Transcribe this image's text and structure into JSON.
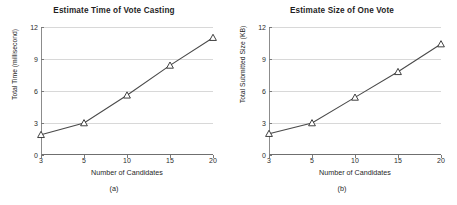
{
  "figure": {
    "background": "#ffffff",
    "line_color": "#4a4a4a",
    "marker_color": "#2b2b2b",
    "grid_color": "#d8d8d8",
    "axis_color": "#6f6f6f"
  },
  "panels": [
    {
      "caption": "(a)",
      "chart_data": {
        "type": "line",
        "title": "Estimate Time of Vote Casting",
        "xlabel": "Number of Candidates",
        "ylabel": "Total Time (millisecond)",
        "x": [
          3,
          5,
          10,
          15,
          20
        ],
        "xtick_labels": [
          "3",
          "5",
          "10",
          "15",
          "20"
        ],
        "values": [
          1.9,
          3.0,
          5.6,
          8.4,
          11.0
        ],
        "ytick_labels": [
          "0",
          "3",
          "6",
          "9",
          "12"
        ],
        "yticks": [
          0,
          3,
          6,
          9,
          12
        ],
        "ylim": [
          0,
          12
        ],
        "grid": "horizontal",
        "legend": "none",
        "marker": "open-triangle"
      }
    },
    {
      "caption": "(b)",
      "chart_data": {
        "type": "line",
        "title": "Estimate Size of One Vote",
        "xlabel": "Number of Candidates",
        "ylabel": "Total Submitted Size (KB)",
        "x": [
          3,
          5,
          10,
          15,
          20
        ],
        "xtick_labels": [
          "3",
          "5",
          "10",
          "15",
          "20"
        ],
        "values": [
          2.0,
          3.0,
          5.4,
          7.8,
          10.4
        ],
        "ytick_labels": [
          "0",
          "3",
          "6",
          "9",
          "12"
        ],
        "yticks": [
          0,
          3,
          6,
          9,
          12
        ],
        "ylim": [
          0,
          12
        ],
        "grid": "horizontal",
        "legend": "none",
        "marker": "open-triangle"
      }
    }
  ]
}
